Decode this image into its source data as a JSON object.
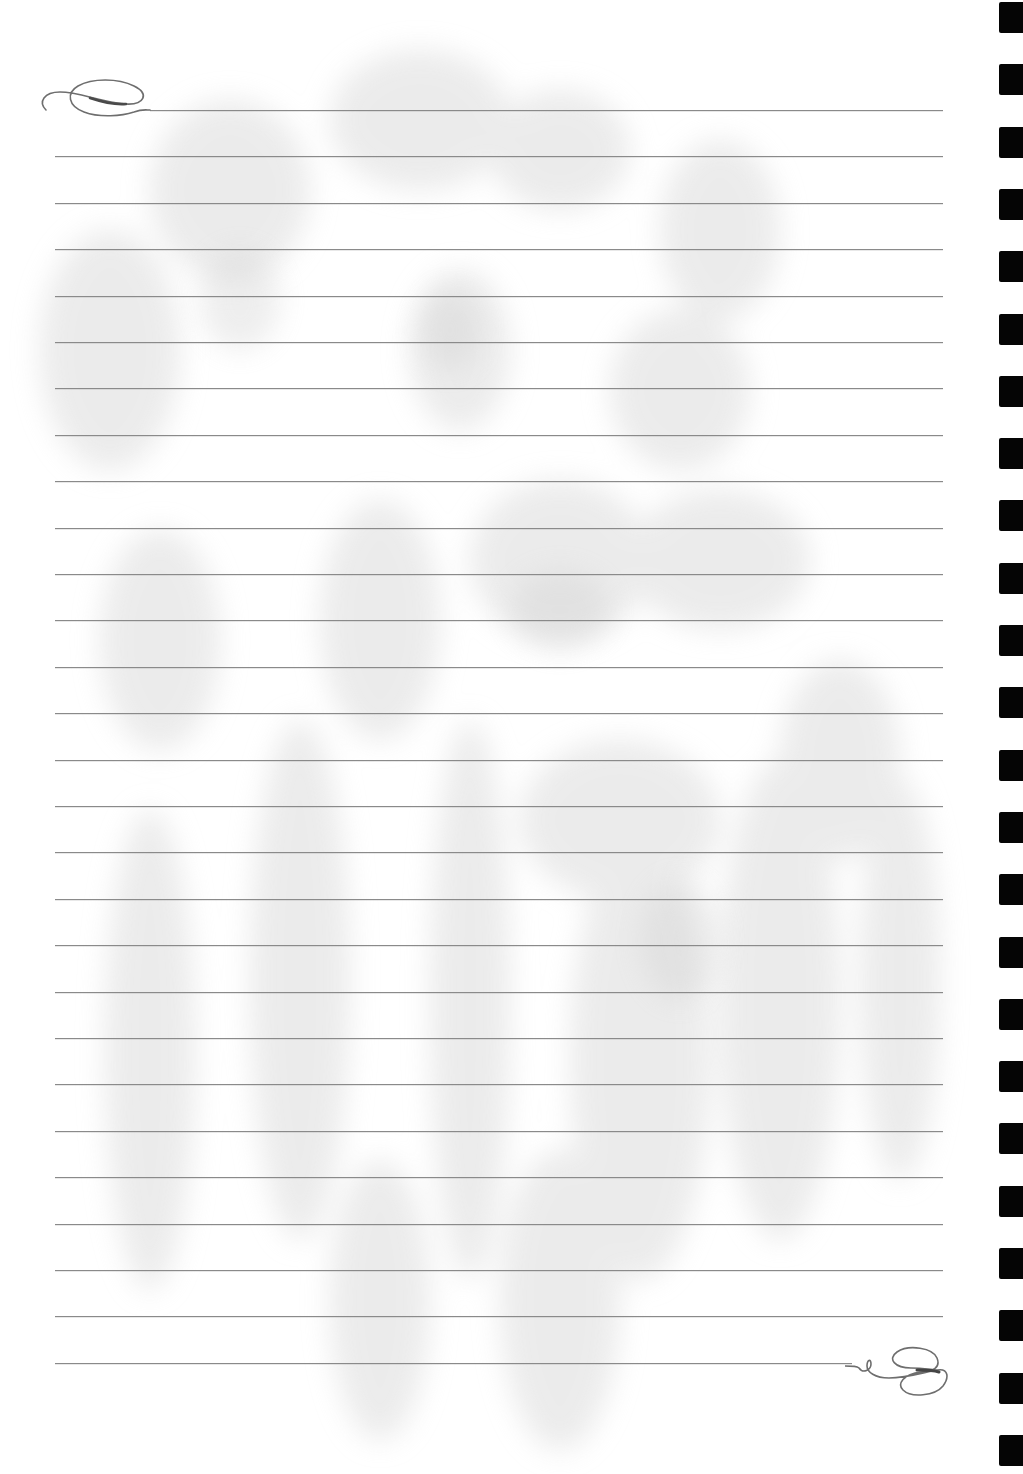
{
  "page": {
    "type": "lined-stationery",
    "background_color": "#ffffff",
    "line_color": "#8a8a8a",
    "hole_color": "#050505",
    "watermark_color": "#e6e6e6",
    "watermark_motif": "iris-flowers"
  },
  "lines": {
    "count": 28,
    "first_y": 110,
    "spacing": 46.4,
    "left_x": 55,
    "right_x": 943,
    "first_line_start_x": 150,
    "last_line_end_x": 852
  },
  "binding_holes": {
    "count": 24,
    "first_y": 2,
    "spacing": 62.3,
    "x": 999,
    "width": 24,
    "height": 31
  },
  "flourishes": {
    "top_left": "swirl-flourish-icon",
    "bottom_right": "swirl-flourish-icon"
  }
}
